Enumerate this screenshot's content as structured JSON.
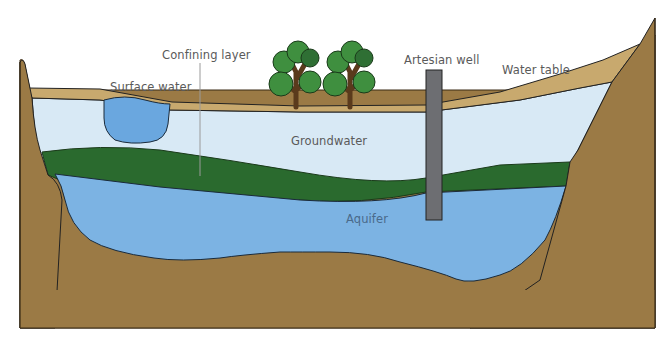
{
  "diagram": {
    "labels": {
      "confining_layer": "Confining layer",
      "surface_water": "Surface water",
      "artesian_well": "Artesian well",
      "water_table": "Water table",
      "groundwater": "Groundwater",
      "aquifer": "Aquifer"
    },
    "colors": {
      "bedrock": "#9b7a45",
      "topsoil": "#c8a96e",
      "groundwater": "#d8e9f5",
      "confining_layer": "#2a6a2e",
      "aquifer": "#7cb3e3",
      "surface_water": "#6aa7df",
      "well": "#6d6e72",
      "tree_foliage": "#3f8f3f",
      "tree_foliage_dark": "#2f6f34",
      "tree_trunk": "#5a3a1c",
      "outline": "#222222",
      "label_text": "#5a5a5a"
    }
  }
}
